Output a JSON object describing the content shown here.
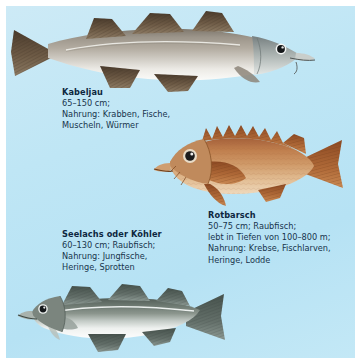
{
  "plate": {
    "background_color": "#bfe6f5",
    "page_color": "#ffffff"
  },
  "species": [
    {
      "id": "kabeljau",
      "name": "Kabeljau",
      "lines": [
        "65–150 cm;",
        "Nahrung: Krabben, Fische,",
        "Muscheln, Würmer"
      ],
      "illustration": {
        "name": "cod-illustration",
        "facing": "right",
        "body_color": "#9a9288",
        "belly_color": "#e8e6e0",
        "fin_color": "#6d5a46"
      }
    },
    {
      "id": "rotbarsch",
      "name": "Rotbarsch",
      "lines": [
        "50–75 cm; Raubfisch;",
        "lebt in Tiefen von 100–800 m;",
        "Nahrung: Krebse, Fischlarven,",
        "Heringe, Lodde"
      ],
      "illustration": {
        "name": "redfish-illustration",
        "facing": "left",
        "body_color": "#c07a47",
        "belly_color": "#e8c9a4",
        "fin_color": "#a85c2c"
      }
    },
    {
      "id": "seelachs",
      "name": "Seelachs oder Köhler",
      "lines": [
        "60–130 cm; Raubfisch;",
        "Nahrung: Jungfische,",
        "Heringe, Sprotten"
      ],
      "illustration": {
        "name": "pollock-illustration",
        "facing": "left",
        "body_color": "#6f7a72",
        "belly_color": "#f2f4f3",
        "fin_color": "#5a6660"
      }
    }
  ]
}
